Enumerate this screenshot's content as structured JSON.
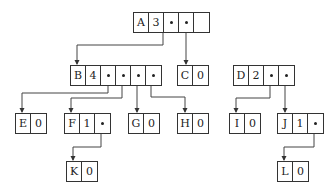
{
  "diagram": {
    "type": "generalized-list-tree-storage",
    "nodes": [
      {
        "id": "A",
        "cells": [
          "A",
          "3",
          "•",
          "•",
          ""
        ],
        "x": 133,
        "y": 12
      },
      {
        "id": "B",
        "cells": [
          "B",
          "4",
          "•",
          "•",
          "•",
          "•"
        ],
        "x": 70,
        "y": 65
      },
      {
        "id": "C",
        "cells": [
          "C",
          "0"
        ],
        "x": 177,
        "y": 65
      },
      {
        "id": "D",
        "cells": [
          "D",
          "2",
          "•",
          "•"
        ],
        "x": 233,
        "y": 65
      },
      {
        "id": "E",
        "cells": [
          "E",
          "0"
        ],
        "x": 15,
        "y": 113
      },
      {
        "id": "F",
        "cells": [
          "F",
          "1",
          "•"
        ],
        "x": 64,
        "y": 113
      },
      {
        "id": "G",
        "cells": [
          "G",
          "0"
        ],
        "x": 128,
        "y": 113
      },
      {
        "id": "H",
        "cells": [
          "H",
          "0"
        ],
        "x": 177,
        "y": 113
      },
      {
        "id": "I",
        "cells": [
          "I",
          "0"
        ],
        "x": 229,
        "y": 113
      },
      {
        "id": "J",
        "cells": [
          "J",
          "1",
          "•"
        ],
        "x": 277,
        "y": 113
      },
      {
        "id": "K",
        "cells": [
          "K",
          "0"
        ],
        "x": 66,
        "y": 161
      },
      {
        "id": "L",
        "cells": [
          "L",
          "0"
        ],
        "x": 277,
        "y": 161
      }
    ],
    "edges": [
      {
        "from": "A",
        "to": "B"
      },
      {
        "from": "A",
        "to": "C"
      },
      {
        "from": "B",
        "to": "E"
      },
      {
        "from": "B",
        "to": "F"
      },
      {
        "from": "B",
        "to": "G"
      },
      {
        "from": "B",
        "to": "H"
      },
      {
        "from": "D",
        "to": "I"
      },
      {
        "from": "D",
        "to": "J"
      },
      {
        "from": "F",
        "to": "K"
      },
      {
        "from": "J",
        "to": "L"
      }
    ]
  }
}
